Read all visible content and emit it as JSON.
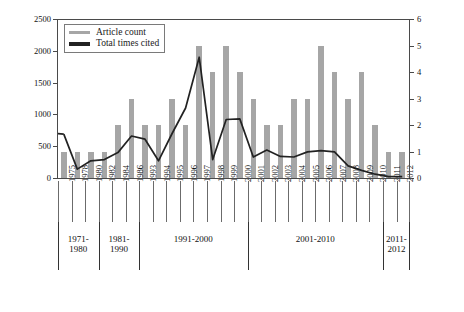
{
  "chart_data": {
    "type": "bar",
    "title": "",
    "xlabel": "",
    "ylabel": "",
    "y2label": "",
    "ylim": [
      0,
      2500
    ],
    "y2lim": [
      0,
      6
    ],
    "grid": false,
    "legend_position": "top-left",
    "categories": [
      "1975",
      "1978",
      "1980",
      "1982",
      "1984",
      "1986",
      "1993",
      "1994",
      "1995",
      "1996",
      "1997",
      "1998",
      "1999",
      "2000",
      "2001",
      "2002",
      "2003",
      "2004",
      "2005",
      "2006",
      "2007",
      "2008",
      "2009",
      "2010",
      "2011",
      "2012"
    ],
    "y_ticks": [
      "0",
      "500",
      "1000",
      "1500",
      "2000",
      "2500"
    ],
    "y2_ticks": [
      "0",
      "1",
      "2",
      "3",
      "4",
      "5",
      "6"
    ],
    "series": [
      {
        "name": "Article count",
        "axis": "right",
        "type": "bar",
        "color": "#a6a6a6",
        "values": [
          1,
          1,
          1,
          1,
          2,
          3,
          2,
          2,
          3,
          2,
          5,
          4,
          5,
          4,
          3,
          2,
          2,
          3,
          3,
          5,
          4,
          3,
          4,
          2,
          1,
          1
        ]
      },
      {
        "name": "Total times cited",
        "axis": "left",
        "type": "line",
        "color": "#222222",
        "values": [
          690,
          140,
          270,
          290,
          400,
          660,
          610,
          270,
          700,
          1100,
          1900,
          290,
          920,
          930,
          330,
          440,
          340,
          330,
          410,
          430,
          410,
          190,
          120,
          60,
          20,
          20
        ]
      }
    ],
    "groups": [
      {
        "label_lines": [
          "1971-",
          "1980"
        ],
        "start": "1975",
        "end": "1980"
      },
      {
        "label_lines": [
          "1981-",
          "1990"
        ],
        "start": "1982",
        "end": "1986"
      },
      {
        "label_lines": [
          "1991-2000"
        ],
        "start": "1993",
        "end": "2000"
      },
      {
        "label_lines": [
          "2001-2010"
        ],
        "start": "2001",
        "end": "2010"
      },
      {
        "label_lines": [
          "2011-",
          "2012"
        ],
        "start": "2011",
        "end": "2012"
      }
    ]
  },
  "legend": {
    "items": [
      {
        "label": "Article count",
        "color": "#a6a6a6",
        "weight": "thin"
      },
      {
        "label": "Total times cited",
        "color": "#222222",
        "weight": "thick"
      }
    ]
  },
  "caption": {
    "text": ""
  }
}
